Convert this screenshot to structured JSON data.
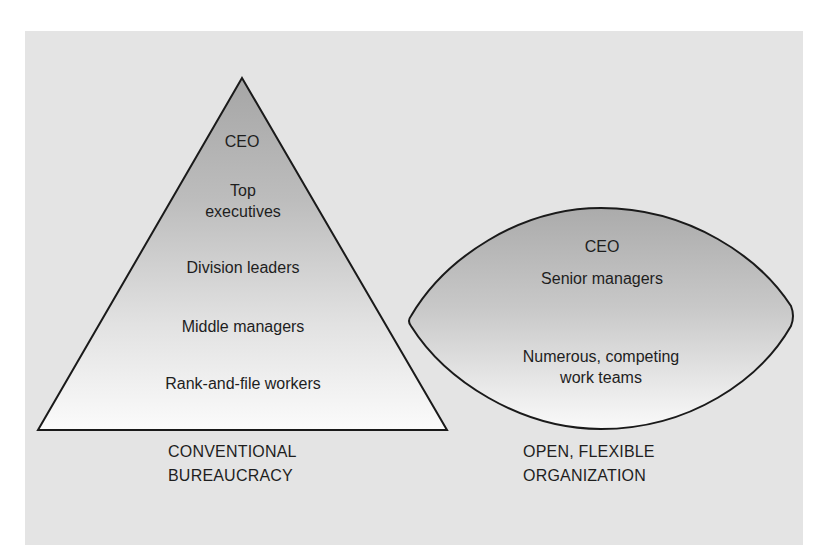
{
  "colors": {
    "panel_bg": "#e4e4e4",
    "shape_fill_top": "#a6a6a6",
    "shape_fill_bottom": "#fafafa",
    "outline": "#1a1a1a",
    "text": "#1e1e1e"
  },
  "pyramid": {
    "title_line1": "CONVENTIONAL",
    "title_line2": "BUREAUCRACY",
    "levels": [
      {
        "label": "CEO"
      },
      {
        "label_line1": "Top",
        "label_line2": "executives"
      },
      {
        "label": "Division leaders"
      },
      {
        "label": "Middle managers"
      },
      {
        "label": "Rank-and-file workers"
      }
    ]
  },
  "lens": {
    "title_line1": "OPEN, FLEXIBLE",
    "title_line2": "ORGANIZATION",
    "levels": [
      {
        "label": "CEO"
      },
      {
        "label": "Senior managers"
      },
      {
        "label_line1": "Numerous, competing",
        "label_line2": "work teams"
      }
    ]
  }
}
